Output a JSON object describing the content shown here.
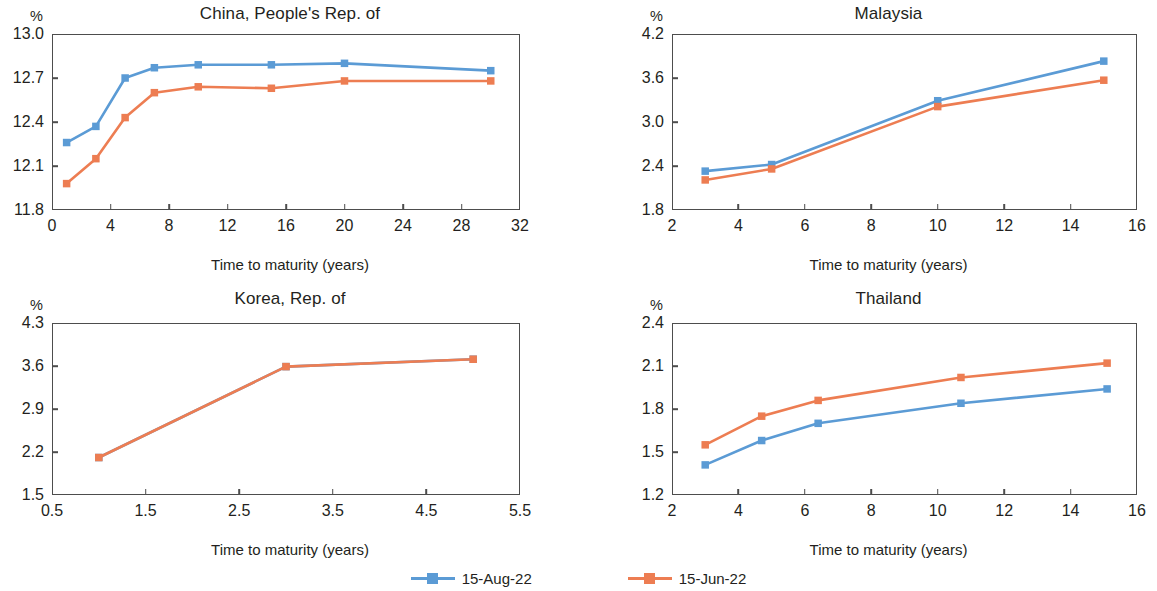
{
  "figure": {
    "unit_label": "%",
    "x_axis_title": "Time to maturity (years)"
  },
  "legend": {
    "entries": [
      {
        "label": "15-Aug-22",
        "color": "#5b9bd5"
      },
      {
        "label": "15-Jun-22",
        "color": "#ed7d52"
      }
    ]
  },
  "colors": {
    "series_aug": "#5b9bd5",
    "series_jun": "#ed7d52",
    "axis": "#4d4d4d",
    "text": "#231f20",
    "background": "#ffffff"
  },
  "chart_data": [
    {
      "type": "line",
      "title": "China, People's Rep. of",
      "xlabel": "Time to maturity (years)",
      "ylabel": "%",
      "xlim": [
        0,
        32
      ],
      "ylim": [
        11.8,
        13.0
      ],
      "xticks": [
        0,
        4,
        8,
        12,
        16,
        20,
        24,
        28,
        32
      ],
      "xtick_labels": [
        "0",
        "4",
        "8",
        "12",
        "16",
        "20",
        "24",
        "28",
        "32"
      ],
      "yticks": [
        11.8,
        12.1,
        12.4,
        12.7,
        13.0
      ],
      "ytick_labels": [
        "11.8",
        "12.1",
        "12.4",
        "12.7",
        "13.0"
      ],
      "grid": false,
      "legend_position": "bottom-figure",
      "series": [
        {
          "name": "15-Aug-22",
          "color": "#5b9bd5",
          "x": [
            1,
            3,
            5,
            7,
            10,
            15,
            20,
            30
          ],
          "values": [
            12.26,
            12.37,
            12.7,
            12.77,
            12.79,
            12.79,
            12.8,
            12.75
          ]
        },
        {
          "name": "15-Jun-22",
          "color": "#ed7d52",
          "x": [
            1,
            3,
            5,
            7,
            10,
            15,
            20,
            30
          ],
          "values": [
            11.98,
            12.15,
            12.43,
            12.6,
            12.64,
            12.63,
            12.68,
            12.68
          ]
        }
      ]
    },
    {
      "type": "line",
      "title": "Malaysia",
      "xlabel": "Time to maturity (years)",
      "ylabel": "%",
      "xlim": [
        2,
        16
      ],
      "ylim": [
        1.8,
        4.2
      ],
      "xticks": [
        2,
        4,
        6,
        8,
        10,
        12,
        14,
        16
      ],
      "xtick_labels": [
        "2",
        "4",
        "6",
        "8",
        "10",
        "12",
        "14",
        "16"
      ],
      "yticks": [
        1.8,
        2.4,
        3.0,
        3.6,
        4.2
      ],
      "ytick_labels": [
        "1.8",
        "2.4",
        "3.0",
        "3.6",
        "4.2"
      ],
      "grid": false,
      "legend_position": "bottom-figure",
      "series": [
        {
          "name": "15-Aug-22",
          "color": "#5b9bd5",
          "x": [
            3,
            5,
            10,
            15
          ],
          "values": [
            2.33,
            2.42,
            3.29,
            3.83
          ]
        },
        {
          "name": "15-Jun-22",
          "color": "#ed7d52",
          "x": [
            3,
            5,
            10,
            15
          ],
          "values": [
            2.21,
            2.36,
            3.21,
            3.57
          ]
        }
      ]
    },
    {
      "type": "line",
      "title": "Korea, Rep. of",
      "xlabel": "Time to maturity (years)",
      "ylabel": "%",
      "xlim": [
        0.5,
        5.5
      ],
      "ylim": [
        1.5,
        4.3
      ],
      "xticks": [
        0.5,
        1.5,
        2.5,
        3.5,
        4.5,
        5.5
      ],
      "xtick_labels": [
        "0.5",
        "1.5",
        "2.5",
        "3.5",
        "4.5",
        "5.5"
      ],
      "yticks": [
        1.5,
        2.2,
        2.9,
        3.6,
        4.3
      ],
      "ytick_labels": [
        "1.5",
        "2.2",
        "2.9",
        "3.6",
        "4.3"
      ],
      "grid": false,
      "legend_position": "bottom-figure",
      "series": [
        {
          "name": "15-Aug-22",
          "color": "#5b9bd5",
          "x": [
            1,
            3,
            5
          ],
          "values": [
            2.11,
            3.59,
            3.71
          ]
        },
        {
          "name": "15-Jun-22",
          "color": "#ed7d52",
          "x": [
            1,
            3,
            5
          ],
          "values": [
            2.11,
            3.59,
            3.71
          ]
        }
      ]
    },
    {
      "type": "line",
      "title": "Thailand",
      "xlabel": "Time to maturity (years)",
      "ylabel": "%",
      "xlim": [
        2,
        16
      ],
      "ylim": [
        1.2,
        2.4
      ],
      "xticks": [
        2,
        4,
        6,
        8,
        10,
        12,
        14,
        16
      ],
      "xtick_labels": [
        "2",
        "4",
        "6",
        "8",
        "10",
        "12",
        "14",
        "16"
      ],
      "yticks": [
        1.2,
        1.5,
        1.8,
        2.1,
        2.4
      ],
      "ytick_labels": [
        "1.2",
        "1.5",
        "1.8",
        "2.1",
        "2.4"
      ],
      "grid": false,
      "legend_position": "bottom-figure",
      "series": [
        {
          "name": "15-Aug-22",
          "color": "#5b9bd5",
          "x": [
            3,
            4.7,
            6.4,
            10.7,
            15.1
          ],
          "values": [
            1.41,
            1.58,
            1.7,
            1.84,
            1.94
          ]
        },
        {
          "name": "15-Jun-22",
          "color": "#ed7d52",
          "x": [
            3,
            4.7,
            6.4,
            10.7,
            15.1
          ],
          "values": [
            1.55,
            1.75,
            1.86,
            2.02,
            2.12
          ]
        }
      ]
    }
  ]
}
